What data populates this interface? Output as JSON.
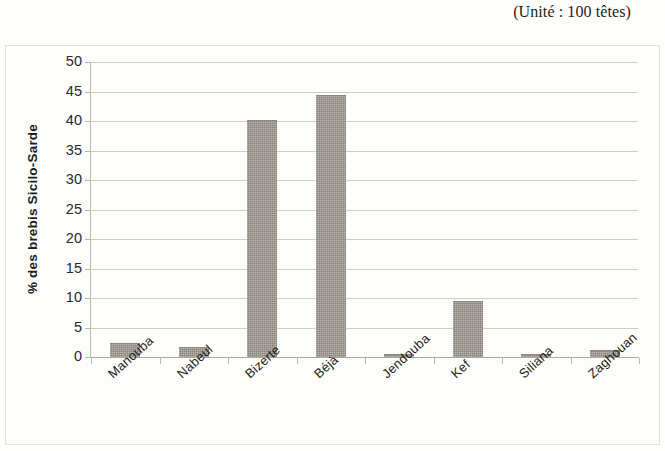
{
  "caption": {
    "unit_note": "(Unité : 100 têtes)"
  },
  "chart_data": {
    "type": "bar",
    "title": "",
    "subtitle": "",
    "annotation": "(Unité : 100 têtes)",
    "xlabel": "",
    "ylabel": "% des brebis Sicilo-Sarde",
    "ylim": [
      0,
      50
    ],
    "ytick_step": 5,
    "yticks": [
      50,
      45,
      40,
      35,
      30,
      25,
      20,
      15,
      10,
      5,
      0
    ],
    "ytick_labels": [
      "50",
      "45",
      "40",
      "35",
      "30",
      "25",
      "20",
      "15",
      "10",
      "5",
      "0"
    ],
    "grid": true,
    "grid_axis": "y",
    "legend": false,
    "legend_position": "none",
    "orientation": "vertical",
    "categories": [
      "Manouba",
      "Nabeul",
      "Bizerte",
      "Béjà",
      "Jendouba",
      "Kef",
      "Siliana",
      "Zaghouan"
    ],
    "values": [
      2.2,
      1.5,
      40.0,
      44.2,
      0.4,
      9.3,
      0.3,
      1.0
    ],
    "series": [
      {
        "name": "% des brebis Sicilo-Sarde",
        "values": [
          2.2,
          1.5,
          40.0,
          44.2,
          0.4,
          9.3,
          0.3,
          1.0
        ]
      }
    ],
    "colors": {
      "bar_fill": "#9a948c",
      "bar_edge": "#8d877f",
      "gridline": "#cfcfbe",
      "axis": "#b9b9a8",
      "text": "#1d1d1b",
      "background": "#fdfdfb",
      "frame_border": "#e3e2da"
    }
  }
}
